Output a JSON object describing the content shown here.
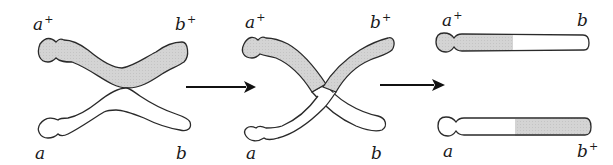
{
  "colors": {
    "outline": "#2a2a2a",
    "shaded": "#d2d2d2",
    "unshaded": "#ffffff",
    "arrow": "#111111",
    "label": "#1a1a1a"
  },
  "panels": [
    {
      "id": "paired-homologs",
      "labels": {
        "top_left": {
          "base": "a",
          "sup": "+"
        },
        "top_right": {
          "base": "b",
          "sup": "+"
        },
        "bottom_left": {
          "base": "a",
          "sup": ""
        },
        "bottom_right": {
          "base": "b",
          "sup": ""
        }
      }
    },
    {
      "id": "crossing-over",
      "labels": {
        "top_left": {
          "base": "a",
          "sup": "+"
        },
        "top_right": {
          "base": "b",
          "sup": "+"
        },
        "bottom_left": {
          "base": "a",
          "sup": ""
        },
        "bottom_right": {
          "base": "b",
          "sup": ""
        }
      }
    },
    {
      "id": "recombinant-chromosomes",
      "labels": {
        "top_left": {
          "base": "a",
          "sup": "+"
        },
        "top_right": {
          "base": "b",
          "sup": ""
        },
        "bottom_left": {
          "base": "a",
          "sup": ""
        },
        "bottom_right": {
          "base": "b",
          "sup": "+"
        }
      }
    }
  ],
  "arrows": [
    {
      "from": "paired-homologs",
      "to": "crossing-over"
    },
    {
      "from": "crossing-over",
      "to": "recombinant-chromosomes"
    }
  ]
}
